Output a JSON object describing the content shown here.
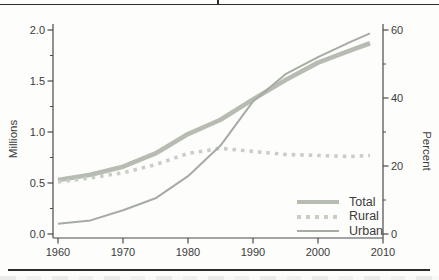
{
  "rules": {
    "top_rule": "full-width dark rule",
    "bottom_rule": "page rule below x-axis labels"
  },
  "chart_data": {
    "type": "line",
    "title": "",
    "x": [
      1960,
      1965,
      1970,
      1975,
      1980,
      1985,
      1990,
      1995,
      2000,
      2005,
      2008
    ],
    "series": [
      {
        "name": "Total",
        "axis": "left",
        "unit": "millions",
        "style": "thick-solid",
        "color": "#b6bcb1",
        "width": 4.6,
        "values": [
          0.53,
          0.58,
          0.66,
          0.79,
          0.98,
          1.12,
          1.32,
          1.51,
          1.68,
          1.8,
          1.87
        ]
      },
      {
        "name": "Rural",
        "axis": "left",
        "unit": "millions",
        "style": "dashed",
        "color": "#c9cec5",
        "width": 3.6,
        "dash": "3.5 5",
        "values": [
          0.51,
          0.55,
          0.6,
          0.68,
          0.79,
          0.84,
          0.81,
          0.78,
          0.77,
          0.76,
          0.77
        ]
      },
      {
        "name": "Urban",
        "axis": "right",
        "unit": "percent",
        "style": "thin-solid",
        "color": "#a6aca3",
        "width": 2,
        "values": [
          3,
          4,
          7,
          10.5,
          17,
          26,
          39,
          47,
          52,
          56.5,
          59
        ]
      }
    ],
    "axes": {
      "left": {
        "label": "Millions",
        "range": [
          0,
          2
        ],
        "ticks": [
          0,
          0.5,
          1,
          1.5,
          2
        ],
        "tick_labels": [
          "0.0",
          "0.5",
          "1.0",
          "1.5",
          "2.0"
        ],
        "minor_ticks": [
          0.25,
          0.75,
          1.25,
          1.75
        ]
      },
      "right": {
        "label": "Percent",
        "range": [
          0,
          60
        ],
        "ticks": [
          0,
          20,
          40,
          60
        ],
        "tick_labels": [
          "0",
          "20",
          "40",
          "60"
        ],
        "minor_ticks": [
          10,
          30,
          50
        ]
      },
      "x": {
        "range": [
          1960,
          2010
        ],
        "ticks": [
          1960,
          1970,
          1980,
          1990,
          2000,
          2010
        ],
        "tick_labels": [
          "1960",
          "1970",
          "1980",
          "1990",
          "2000",
          "2010"
        ]
      }
    },
    "legend": {
      "position": "bottom-right-inside-plot",
      "entries": [
        "Total",
        "Rural",
        "Urban"
      ]
    },
    "grid": false,
    "colors": {
      "axis": "#4a4a4a",
      "text": "#3b3b3b",
      "background": "#fdfdfc",
      "page_rule": "#2e2e2e"
    }
  }
}
